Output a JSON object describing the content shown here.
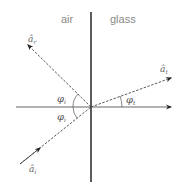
{
  "regions": {
    "left": "air",
    "right": "glass"
  },
  "vectors": {
    "reflected": {
      "symbol": "â",
      "sub": "r"
    },
    "transmitted": {
      "symbol": "â",
      "sub": "t"
    },
    "incident": {
      "symbol": "â",
      "sub": "i"
    }
  },
  "angles": {
    "reflection": {
      "symbol": "φ",
      "sub": "i"
    },
    "incidence": {
      "symbol": "φ",
      "sub": "i"
    },
    "transmission": {
      "symbol": "φ",
      "sub": "t"
    }
  }
}
